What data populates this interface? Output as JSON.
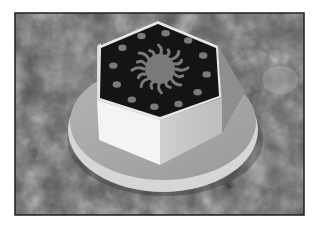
{
  "image": {
    "description": "Grayscale 3D render of a hexagonal bolt head with a sun emblem and ring of dots on its top face, seated on a circular flange, over a granite-textured background",
    "subject": "hex-bolt-head",
    "top_face_pattern": {
      "emblem": "sun",
      "dot_count": 12
    },
    "palette": {
      "background_dark": "#4a4a4a",
      "background_light": "#8c8c8c",
      "frame": "#1e1e1e",
      "top_face": "#141414",
      "emblem": "#7a7a7a",
      "side_left": "#f4f4f4",
      "side_right": "#c8c8c8",
      "flange_top": "#a8a8a8",
      "flange_edge": "#d6d6d6"
    }
  }
}
